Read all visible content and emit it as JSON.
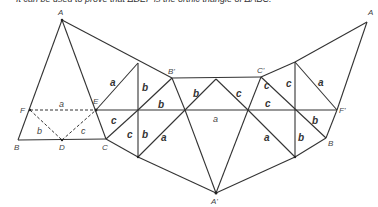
{
  "caption": "It can be used to prove that ΔDEF is the orthic triangle of ΔABC.",
  "vertices": {
    "A_left": {
      "label": "A",
      "x": 62,
      "y": 20
    },
    "A_right": {
      "label": "A",
      "x": 367,
      "y": 22
    },
    "A_prime": {
      "label": "A'",
      "x": 216,
      "y": 193
    },
    "B": {
      "label": "B",
      "x": 18,
      "y": 140
    },
    "B_right": {
      "label": "B",
      "x": 326,
      "y": 138
    },
    "B_prime": {
      "label": "B'",
      "x": 172,
      "y": 78
    },
    "C": {
      "label": "C",
      "x": 106,
      "y": 139
    },
    "C_prime": {
      "label": "C'",
      "x": 261,
      "y": 77
    },
    "D": {
      "label": "D",
      "x": 62,
      "y": 140
    },
    "E": {
      "label": "E",
      "x": 96,
      "y": 110
    },
    "F": {
      "label": "F",
      "x": 30,
      "y": 110
    },
    "F_prime": {
      "label": "F'",
      "x": 337,
      "y": 110
    }
  },
  "side_labels": {
    "dashed_a": "a",
    "dashed_b": "b",
    "dashed_c": "c",
    "s1": "a",
    "s2": "b",
    "s3": "b",
    "s4": "b",
    "s5": "c",
    "s6": "c",
    "s7": "c",
    "s8": "c",
    "s9": "a",
    "s10": "a",
    "s11": "a",
    "s12": "c",
    "s13": "c",
    "s14": "a",
    "s15": "b",
    "s16": "b",
    "s17": "b"
  }
}
